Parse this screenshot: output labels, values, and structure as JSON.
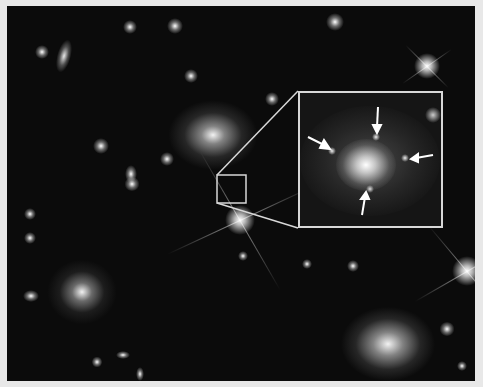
{
  "image": {
    "description": "Deep-field image of a galaxy cluster with a zoomed inset showing a galaxy with four lensed images marked by arrows",
    "colors": {
      "background_frame": "#e8e8e8",
      "sky": "#0b0b0b",
      "inset_border": "#d8d8d8"
    },
    "frame": {
      "x": 7,
      "y": 6,
      "width": 468,
      "height": 375
    },
    "highlight_box": {
      "x": 217,
      "y": 175,
      "width": 29,
      "height": 28
    },
    "inset": {
      "x": 298,
      "y": 91,
      "width": 145,
      "height": 137,
      "arrow_count": 4
    },
    "bright_stars": [
      {
        "x": 240,
        "y": 220
      },
      {
        "x": 427,
        "y": 66
      },
      {
        "x": 467,
        "y": 271
      }
    ],
    "large_galaxies": [
      {
        "x": 213,
        "y": 135
      },
      {
        "x": 82,
        "y": 292
      },
      {
        "x": 388,
        "y": 344
      },
      {
        "x": 63,
        "y": 55
      }
    ]
  }
}
